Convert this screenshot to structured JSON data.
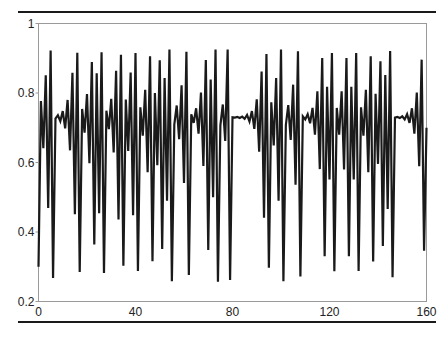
{
  "header": {
    "caption_fragment": ""
  },
  "chart_data": {
    "type": "line",
    "title": "",
    "xlabel": "",
    "ylabel": "",
    "xlim": [
      0,
      160
    ],
    "ylim": [
      0.2,
      1
    ],
    "grid": false,
    "legend": null,
    "x_ticks": [
      "0",
      "40",
      "80",
      "120",
      "160"
    ],
    "y_ticks": [
      "0.2",
      "0.4",
      "0.6",
      "0.8",
      "1"
    ],
    "line_color": "#1a1a1a",
    "series": [
      {
        "name": "x(n)",
        "x_start": 0,
        "x_step": 1,
        "values": [
          0.3,
          0.777,
          0.641,
          0.851,
          0.469,
          0.922,
          0.268,
          0.726,
          0.736,
          0.719,
          0.748,
          0.698,
          0.78,
          0.635,
          0.858,
          0.451,
          0.916,
          0.285,
          0.754,
          0.686,
          0.797,
          0.598,
          0.889,
          0.364,
          0.857,
          0.454,
          0.917,
          0.282,
          0.749,
          0.696,
          0.783,
          0.629,
          0.864,
          0.436,
          0.91,
          0.303,
          0.781,
          0.633,
          0.859,
          0.448,
          0.915,
          0.288,
          0.759,
          0.677,
          0.809,
          0.572,
          0.906,
          0.316,
          0.8,
          0.592,
          0.894,
          0.351,
          0.843,
          0.49,
          0.925,
          0.258,
          0.709,
          0.764,
          0.667,
          0.822,
          0.541,
          0.919,
          0.276,
          0.739,
          0.714,
          0.756,
          0.683,
          0.801,
          0.59,
          0.895,
          0.348,
          0.839,
          0.5,
          0.925,
          0.257,
          0.707,
          0.767,
          0.662,
          0.925,
          0.262,
          0.73,
          0.729,
          0.731,
          0.728,
          0.732,
          0.726,
          0.737,
          0.718,
          0.748,
          0.697,
          0.782,
          0.631,
          0.862,
          0.441,
          0.912,
          0.297,
          0.773,
          0.649,
          0.843,
          0.49,
          0.925,
          0.258,
          0.708,
          0.765,
          0.665,
          0.824,
          0.536,
          0.92,
          0.272,
          0.733,
          0.724,
          0.739,
          0.713,
          0.757,
          0.68,
          0.805,
          0.581,
          0.901,
          0.33,
          0.818,
          0.551,
          0.915,
          0.287,
          0.757,
          0.68,
          0.805,
          0.58,
          0.901,
          0.33,
          0.818,
          0.551,
          0.915,
          0.288,
          0.759,
          0.677,
          0.809,
          0.572,
          0.906,
          0.315,
          0.798,
          0.596,
          0.891,
          0.36,
          0.852,
          0.466,
          0.921,
          0.27,
          0.729,
          0.731,
          0.728,
          0.733,
          0.724,
          0.739,
          0.714,
          0.756,
          0.683,
          0.801,
          0.589,
          0.896,
          0.346,
          0.7
        ]
      }
    ]
  }
}
